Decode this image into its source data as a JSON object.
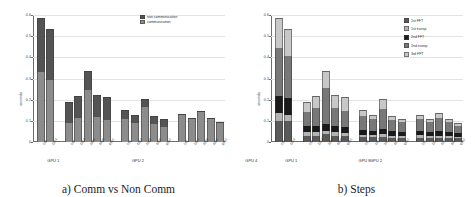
{
  "figure": {
    "panels": [
      {
        "id": "comm-vs-noncomm",
        "caption": "a) Comm vs Non Comm"
      },
      {
        "id": "steps",
        "caption": "b) Steps"
      }
    ]
  },
  "chart_data": [
    {
      "type": "bar",
      "id": "comm-vs-noncomm",
      "title": "a) Comm vs Non Comm",
      "stacked": true,
      "xlabel": "",
      "ylabel": "seconds",
      "ylim": [
        0,
        0.6
      ],
      "yticks": [
        0,
        0.1,
        0.2,
        0.3,
        0.4,
        0.5,
        0.6
      ],
      "ytick_labels": [
        "0",
        "0.1",
        "0.2",
        "0.3",
        "0.4",
        "0.5",
        "0.6"
      ],
      "grid": true,
      "legend_position": "top-right",
      "groups": [
        "GPU 1",
        "GPU 2",
        "GPU 4",
        "GPU 8"
      ],
      "categories": [
        "512",
        "1024",
        "512",
        "1024",
        "2048",
        "4096",
        "8192",
        "512",
        "1024",
        "2048",
        "4096",
        "8192",
        "512",
        "1024",
        "2048",
        "4096",
        "8192"
      ],
      "group_sizes": [
        2,
        5,
        5,
        5
      ],
      "series": [
        {
          "name": "communication",
          "color": "#8c8c8c",
          "values": [
            0.333,
            0.292,
            0.088,
            0.115,
            0.245,
            0.118,
            0.105,
            0.111,
            0.091,
            0.167,
            0.085,
            0.073,
            0.128,
            0.11,
            0.142,
            0.108,
            0.09
          ]
        },
        {
          "name": "non communication",
          "color": "#545454",
          "values": [
            0.253,
            0.243,
            0.102,
            0.104,
            0.092,
            0.104,
            0.11,
            0.038,
            0.038,
            0.038,
            0.038,
            0.038,
            0.005,
            0.005,
            0.005,
            0.005,
            0.005
          ]
        }
      ]
    },
    {
      "type": "bar",
      "id": "steps",
      "title": "b) Steps",
      "stacked": true,
      "xlabel": "",
      "ylabel": "seconds",
      "ylim": [
        0,
        0.6
      ],
      "yticks": [
        0,
        0.1,
        0.2,
        0.3,
        0.4,
        0.5,
        0.6
      ],
      "ytick_labels": [
        "0",
        "0.1",
        "0.2",
        "0.3",
        "0.4",
        "0.5",
        "0.6"
      ],
      "grid": true,
      "legend_position": "right",
      "groups": [
        "GPU 1",
        "GPU 2",
        "GPU 4",
        "GPU 8"
      ],
      "categories": [
        "512",
        "1024",
        "512",
        "1024",
        "2048",
        "4096",
        "8192",
        "512",
        "1024",
        "2048",
        "4096",
        "8192",
        "512",
        "1024",
        "2048",
        "4096",
        "8192"
      ],
      "group_sizes": [
        2,
        5,
        5,
        5
      ],
      "series": [
        {
          "name": "1st FFT",
          "color": "#5a5a5a",
          "values": [
            0.101,
            0.097,
            0.03,
            0.03,
            0.036,
            0.03,
            0.028,
            0.022,
            0.022,
            0.022,
            0.021,
            0.02,
            0.02,
            0.019,
            0.02,
            0.019,
            0.017
          ]
        },
        {
          "name": "1st transp",
          "color": "#b4b4b4",
          "values": [
            0.034,
            0.03,
            0.016,
            0.016,
            0.017,
            0.016,
            0.015,
            0.011,
            0.009,
            0.015,
            0.009,
            0.008,
            0.011,
            0.009,
            0.01,
            0.009,
            0.008
          ]
        },
        {
          "name": "2nd FFT",
          "color": "#1a1a1a",
          "values": [
            0.083,
            0.08,
            0.028,
            0.028,
            0.032,
            0.028,
            0.026,
            0.022,
            0.021,
            0.026,
            0.02,
            0.019,
            0.019,
            0.018,
            0.02,
            0.018,
            0.016
          ]
        },
        {
          "name": "2nd transp",
          "color": "#787878",
          "values": [
            0.224,
            0.2,
            0.068,
            0.087,
            0.17,
            0.085,
            0.078,
            0.067,
            0.057,
            0.094,
            0.055,
            0.048,
            0.057,
            0.047,
            0.062,
            0.047,
            0.035
          ]
        },
        {
          "name": "3rd FFT",
          "color": "#c8c8c8",
          "values": [
            0.144,
            0.128,
            0.048,
            0.058,
            0.082,
            0.063,
            0.068,
            0.027,
            0.02,
            0.048,
            0.018,
            0.016,
            0.021,
            0.017,
            0.023,
            0.017,
            0.014
          ]
        }
      ]
    }
  ]
}
